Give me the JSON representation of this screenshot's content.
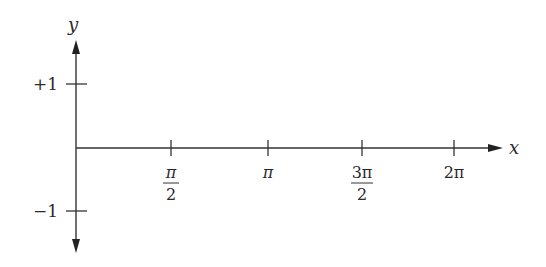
{
  "diagram": {
    "title": "",
    "type": "coordinate-axes",
    "axes": {
      "x_label": "x",
      "y_label": "y",
      "line_color": "#333333"
    },
    "y_ticks": [
      {
        "label": "+1",
        "value": 1
      },
      {
        "label": "−1",
        "value": -1
      }
    ],
    "x_ticks": [
      {
        "label": "π/2",
        "numerator": "π",
        "denominator": "2",
        "is_fraction": true
      },
      {
        "label": "π",
        "numerator": "π",
        "denominator": "",
        "is_fraction": false
      },
      {
        "label": "3π/2",
        "numerator": "3π",
        "denominator": "2",
        "is_fraction": true
      },
      {
        "label": "2π",
        "numerator": "2π",
        "denominator": "",
        "is_fraction": false
      }
    ]
  }
}
